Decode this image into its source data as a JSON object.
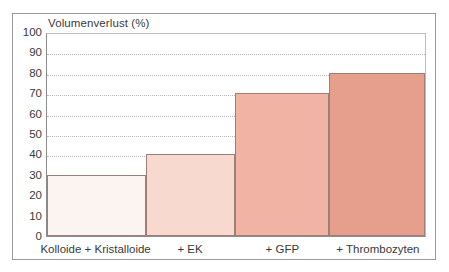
{
  "chart_data": {
    "type": "bar",
    "title": "",
    "ylabel": "Volumenverlust (%)",
    "xlabel": "",
    "categories": [
      "Kolloide + Kristalloide",
      "+ EK",
      "+ GFP",
      "+ Thrombozyten"
    ],
    "values": [
      30,
      40,
      70,
      80
    ],
    "ylim": [
      0,
      100
    ],
    "yticks": [
      0,
      10,
      20,
      30,
      40,
      50,
      60,
      70,
      80,
      90,
      100
    ],
    "ytick_labels": [
      "0",
      "10",
      "20",
      "30",
      "40",
      "50",
      "60",
      "70",
      "80",
      "90",
      "100"
    ],
    "grid": true,
    "legend": "none",
    "bar_colors": [
      "#fbf4f1",
      "#f7d9d0",
      "#f0b3a4",
      "#e79f8d"
    ],
    "bar_edge_color": "#9b7f78",
    "gridline_color": "#b9b9b9",
    "axis_color": "#8d8d8d",
    "frame_color": "#9a9a9a",
    "text_color": "#3a3a3a",
    "background": "#ffffff",
    "bar_widths_pct": [
      26.1,
      23.6,
      25.0,
      25.3
    ]
  }
}
